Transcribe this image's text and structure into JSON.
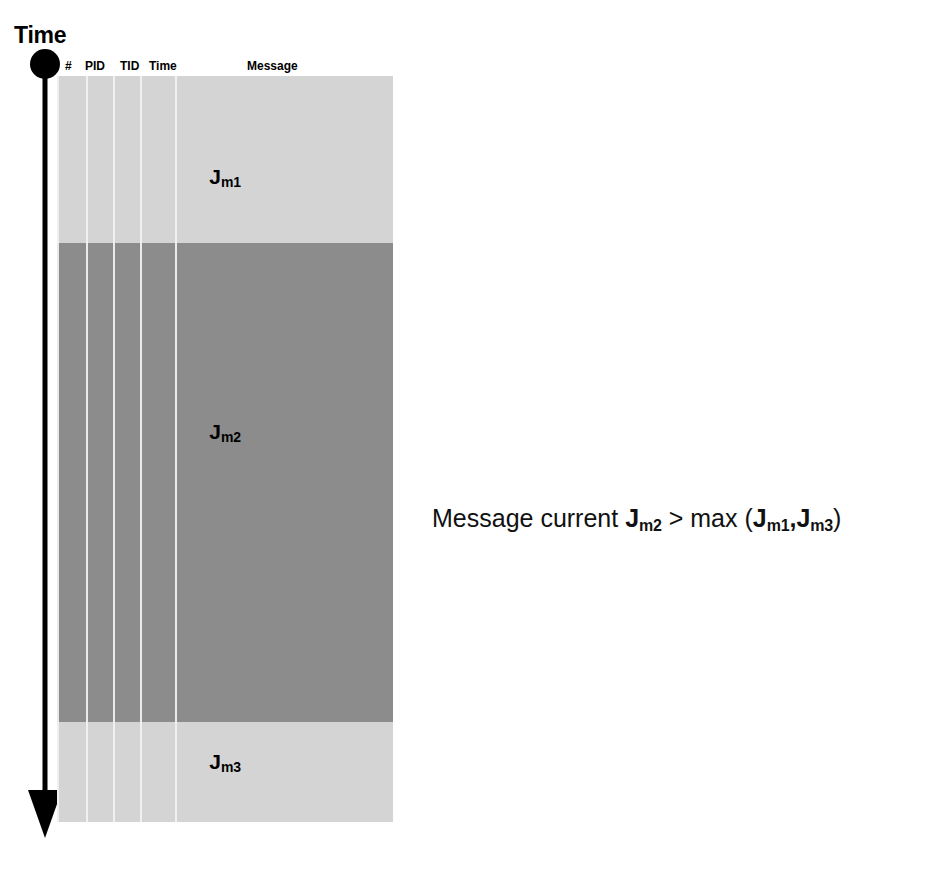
{
  "axis": {
    "title": "Time",
    "direction": "downward",
    "start_marker": "dot",
    "end_marker": "arrowhead"
  },
  "table": {
    "columns": [
      {
        "key": "num",
        "label": "#"
      },
      {
        "key": "pid",
        "label": "PID"
      },
      {
        "key": "tid",
        "label": "TID"
      },
      {
        "key": "time",
        "label": "Time"
      },
      {
        "key": "message",
        "label": "Message"
      }
    ],
    "bands": [
      {
        "id": "band1",
        "label_base": "J",
        "label_sub": "m1",
        "shade": "#d4d4d4",
        "tone": "light"
      },
      {
        "id": "band2",
        "label_base": "J",
        "label_sub": "m2",
        "shade": "#8c8c8c",
        "tone": "dark"
      },
      {
        "id": "band3",
        "label_base": "J",
        "label_sub": "m3",
        "shade": "#d4d4d4",
        "tone": "light"
      }
    ]
  },
  "caption": {
    "lead": "Message current ",
    "term_base": "J",
    "term_sub": "m2",
    "operator": " > max (",
    "arg1_base": "J",
    "arg1_sub": "m1",
    "separator": ",",
    "arg2_base": "J",
    "arg2_sub": "m3",
    "close": ")",
    "full_text": "Message current Jm2 > max (Jm1,Jm3)"
  },
  "colors": {
    "background": "#ffffff",
    "ink": "#000000",
    "band_light": "#d4d4d4",
    "band_dark": "#8c8c8c",
    "separator": "#f2f2f2"
  }
}
